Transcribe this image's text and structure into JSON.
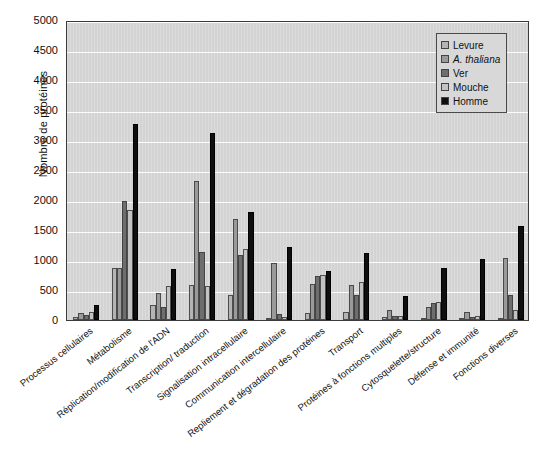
{
  "chart_data": {
    "type": "bar",
    "title": "",
    "xlabel": "",
    "ylabel": "Nombre de protéines",
    "ylim": [
      0,
      5000
    ],
    "yticks": [
      0,
      500,
      1000,
      1500,
      2000,
      2500,
      3000,
      3500,
      4000,
      4500,
      5000
    ],
    "grid": true,
    "legend_position": "top-right",
    "categories": [
      "Processus cellulaires",
      "Métabolisme",
      "Réplication/modification de l'ADN",
      "Transcription/ traduction",
      "Signalisation intracellulaire",
      "Communication intercellulaire",
      "Repliement et dégradation des protéines",
      "Transport",
      "Protéines à fonctions multiples",
      "Cytosquelette/structure",
      "Défense et immunité",
      "Fonctions diverses"
    ],
    "series": [
      {
        "name": "Levure",
        "color": "#b4b4b4",
        "values": [
          55,
          860,
          250,
          580,
          410,
          30,
          125,
          135,
          55,
          40,
          25,
          40
        ]
      },
      {
        "name": "A. thaliana",
        "color": "#9a9a9a",
        "values": [
          120,
          870,
          445,
          2320,
          1690,
          950,
          600,
          590,
          170,
          225,
          135,
          1040
        ]
      },
      {
        "name": "Ver",
        "color": "#6e6e6e",
        "values": [
          90,
          1980,
          210,
          1140,
          1090,
          100,
          740,
          425,
          65,
          280,
          50,
          420
        ]
      },
      {
        "name": "Mouche",
        "color": "#c3c3c3",
        "values": [
          135,
          1830,
          565,
          575,
          1190,
          45,
          745,
          640,
          70,
          305,
          65,
          170
        ]
      },
      {
        "name": "Homme",
        "color": "#0f0f0f",
        "values": [
          245,
          3270,
          845,
          3110,
          1795,
          1225,
          815,
          1120,
          400,
          875,
          1010,
          1565
        ]
      }
    ]
  },
  "legend": {
    "items": [
      {
        "label": "Levure",
        "italic": false,
        "color": "#b4b4b4"
      },
      {
        "label": "A. thaliana",
        "italic": true,
        "color": "#9a9a9a"
      },
      {
        "label": "Ver",
        "italic": false,
        "color": "#6e6e6e"
      },
      {
        "label": "Mouche",
        "italic": false,
        "color": "#c3c3c3"
      },
      {
        "label": "Homme",
        "italic": false,
        "color": "#0f0f0f"
      }
    ]
  },
  "axes": {
    "y_title": "Nombre de protéines",
    "y_tick_labels": [
      "0",
      "500",
      "1000",
      "1500",
      "2000",
      "2500",
      "3000",
      "3500",
      "4000",
      "4500",
      "5000"
    ]
  }
}
